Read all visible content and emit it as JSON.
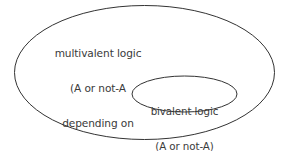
{
  "diagram": {
    "type": "venn-euler-diagram",
    "background_color": "#ffffff",
    "stroke_color": "#333333",
    "text_color": "#3a3a3a",
    "sets": [
      {
        "id": "outer",
        "name": "multivalent-logic-set",
        "label_lines": [
          "multivalent logic",
          "(A or not-A",
          "depending on",
          "perspective)"
        ],
        "title": "multivalent logic",
        "qualifier": "(A or not-A depending on perspective)",
        "geometry": {
          "cx": 144.5,
          "cy": 72.5,
          "rx": 130,
          "ry": 67
        }
      },
      {
        "id": "inner",
        "name": "bivalent-logic-set",
        "label_lines": [
          "bivalent logic",
          "(A or not-A)"
        ],
        "title": "bivalent logic",
        "qualifier": "(A or not-A)",
        "geometry": {
          "cx": 184.5,
          "cy": 94,
          "rx": 52.5,
          "ry": 18
        }
      }
    ]
  }
}
